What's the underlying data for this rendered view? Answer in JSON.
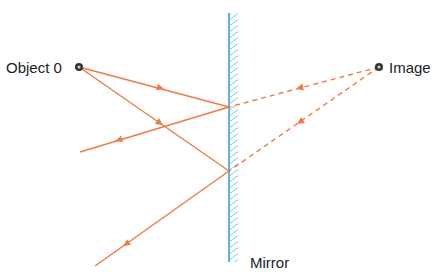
{
  "diagram": {
    "labels": {
      "object": "Object 0",
      "image": "Image",
      "mirror": "Mirror"
    },
    "colors": {
      "ray": "#f07a45",
      "mirror": "#5ab4ea",
      "point": "#333333"
    },
    "points": {
      "object": [
        79,
        67
      ],
      "image": [
        379,
        67
      ],
      "reflection_1": [
        229,
        107
      ],
      "reflection_2": [
        229,
        171
      ]
    },
    "mirror": {
      "x": 229,
      "y1": 13,
      "y2": 262
    }
  }
}
